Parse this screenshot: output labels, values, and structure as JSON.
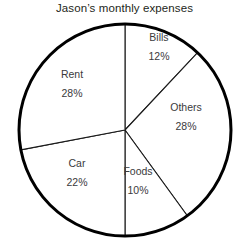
{
  "chart_data": {
    "type": "pie",
    "title": "Jason’s monthly expenses",
    "xlabel": "",
    "ylabel": "",
    "legend": "none",
    "grid": false,
    "units": "percent",
    "categories": [
      "Bills",
      "Others",
      "Foods",
      "Car",
      "Rent"
    ],
    "values": [
      12,
      28,
      10,
      22,
      28
    ],
    "start_angle_deg": 0,
    "direction": "clockwise",
    "total": 100,
    "slices": [
      {
        "label": "Bills",
        "value": 12,
        "value_text": "12%",
        "start_deg": 0.0,
        "end_deg": 43.2,
        "fill": "#ffffff",
        "stroke": "#000000"
      },
      {
        "label": "Others",
        "value": 28,
        "value_text": "28%",
        "start_deg": 43.2,
        "end_deg": 144.0,
        "fill": "#ffffff",
        "stroke": "#000000"
      },
      {
        "label": "Foods",
        "value": 10,
        "value_text": "10%",
        "start_deg": 144.0,
        "end_deg": 180.0,
        "fill": "#ffffff",
        "stroke": "#000000"
      },
      {
        "label": "Car",
        "value": 22,
        "value_text": "22%",
        "start_deg": 180.0,
        "end_deg": 259.2,
        "fill": "#ffffff",
        "stroke": "#000000"
      },
      {
        "label": "Rent",
        "value": 28,
        "value_text": "28%",
        "start_deg": 259.2,
        "end_deg": 360.0,
        "fill": "#ffffff",
        "stroke": "#000000"
      }
    ]
  },
  "chart": {
    "title": "Jason’s monthly expenses",
    "center_x": 125,
    "center_y": 130,
    "radius": 106,
    "outline_color": "#000000",
    "divider_color": "#1a1a1a",
    "background": "#ffffff",
    "text_color": "#3a3a3c",
    "title_color": "#231f20"
  },
  "labels": {
    "bills": {
      "name": "Bills",
      "pct": "12%"
    },
    "others": {
      "name": "Others",
      "pct": "28%"
    },
    "foods": {
      "name": "Foods",
      "pct": "10%"
    },
    "car": {
      "name": "Car",
      "pct": "22%"
    },
    "rent": {
      "name": "Rent",
      "pct": "28%"
    }
  }
}
